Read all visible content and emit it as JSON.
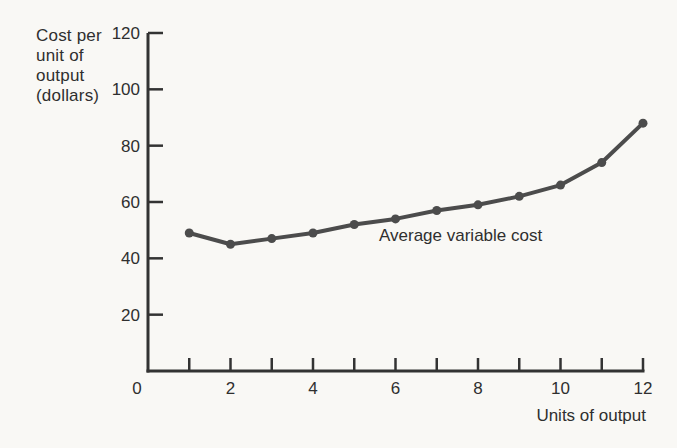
{
  "colors": {
    "background": "#f9f8f5",
    "ink": "#2f2f2f",
    "axis": "#333333",
    "curve": "#4c4c4c"
  },
  "chart_data": {
    "type": "line",
    "title": "",
    "xlabel": "Units of output",
    "ylabel": "Cost per unit of output (dollars)",
    "ylabel_lines": [
      "Cost per",
      "unit of",
      "output",
      "(dollars)"
    ],
    "xlim": [
      0,
      12
    ],
    "ylim": [
      0,
      120
    ],
    "grid": false,
    "legend_position": "inline-annotation",
    "x_axis_ticks": [
      1,
      2,
      3,
      4,
      5,
      6,
      7,
      8,
      9,
      10,
      11,
      12
    ],
    "x_axis_labels": [
      "0",
      "2",
      "4",
      "6",
      "8",
      "10",
      "12"
    ],
    "y_axis_ticks": [
      20,
      40,
      60,
      80,
      100,
      120
    ],
    "series": [
      {
        "name": "Average variable cost",
        "x": [
          1,
          2,
          3,
          4,
          5,
          6,
          7,
          8,
          9,
          10,
          11,
          12
        ],
        "values": [
          49,
          45,
          47,
          49,
          52,
          54,
          57,
          59,
          62,
          66,
          74,
          88
        ],
        "color": "#4c4c4c",
        "marker": "circle"
      }
    ],
    "annotation": {
      "text": "Average variable cost",
      "anchor_x": 5.6,
      "anchor_y": 46
    }
  }
}
